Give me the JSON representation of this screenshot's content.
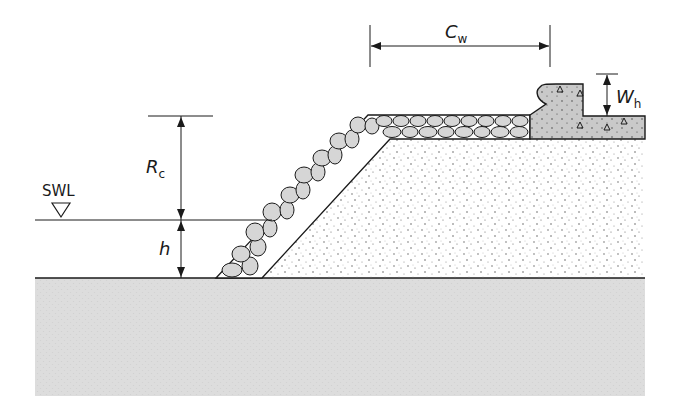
{
  "diagram": {
    "type": "breakwater-cross-section",
    "labels": {
      "swl": "SWL",
      "rc_main": "R",
      "rc_sub": "c",
      "h": "h",
      "cw_main": "C",
      "cw_sub": "w",
      "wh_main": "W",
      "wh_sub": "h"
    },
    "components": [
      "seabed",
      "core",
      "armour-layer",
      "crown-wall",
      "still-water-level"
    ],
    "colors": {
      "line": "#1a1a1a",
      "seabed": "#dcdcdc",
      "armour_stone": "#d6d6d6",
      "crown_wall": "#c8c8c8",
      "core_dots": "#555555"
    }
  }
}
